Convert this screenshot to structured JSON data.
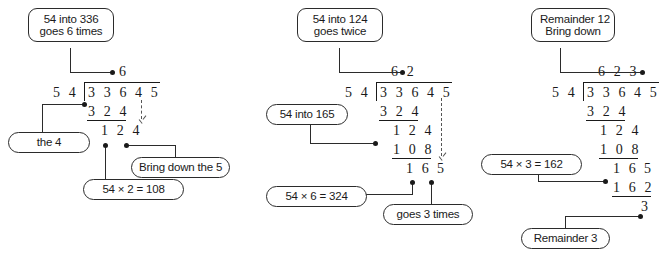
{
  "diagram": {
    "panels": [
      {
        "id": "panel-1",
        "callouts": {
          "top": {
            "line1": "54 into 336",
            "line2": "goes 6 times"
          },
          "the_4": "the 4",
          "multiply": "54 × 2 = 108",
          "bring_down": "Bring down the 5"
        },
        "sum": {
          "quotient": "6",
          "divisor": "5 4",
          "dividend": "3 3 6 4 5",
          "subtract_1": "3 2 4",
          "remainder_1": "1 2 4"
        }
      },
      {
        "id": "panel-2",
        "callouts": {
          "top": {
            "line1": "54 into 124",
            "line2": "goes twice"
          },
          "into_165": "54 into 165",
          "multiply": "54 × 6 = 324",
          "goes_3": "goes 3 times"
        },
        "sum": {
          "quotient": "6 2",
          "divisor": "5 4",
          "dividend": "3 3 6 4 5",
          "subtract_1": "3 2 4",
          "remainder_1": "1 2 4",
          "subtract_2": "1 0 8",
          "remainder_2": "1 6",
          "brought_down": "5"
        }
      },
      {
        "id": "panel-3",
        "callouts": {
          "top": {
            "line1": "Remainder 12",
            "line2": "Bring down"
          },
          "multiply": "54 × 3 = 162",
          "remainder": "Remainder 3"
        },
        "sum": {
          "quotient": "6 2 3",
          "divisor": "5 4",
          "dividend": "3 3 6 4 5",
          "subtract_1": "3 2 4",
          "remainder_1": "1 2 4",
          "subtract_2": "1 0 8",
          "remainder_2": "1 6",
          "brought_down": "5",
          "subtract_3": "1 6 2",
          "final_remainder": "3"
        }
      }
    ],
    "colors": {
      "ink": "#1a1a1a",
      "connector": "#2b2b2b",
      "dashed": "#555555",
      "background": "#ffffff"
    }
  }
}
